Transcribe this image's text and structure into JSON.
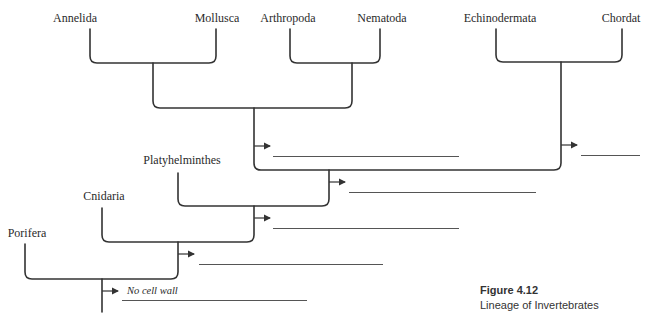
{
  "figure": {
    "number": "Figure 4.12",
    "caption": "Lineage of Invertebrates"
  },
  "taxa": {
    "annelida": "Annelida",
    "mollusca": "Mollusca",
    "arthropoda": "Arthropoda",
    "nematoda": "Nematoda",
    "echinodermata": "Echinodermata",
    "chordata": "Chordat",
    "platyhelminthes": "Platyhelminthes",
    "cnidaria": "Cnidaria",
    "porifera": "Porifera"
  },
  "characters": {
    "first": "No cell wall",
    "second": "",
    "third": "",
    "fourth": "",
    "fifth": "",
    "sixth": ""
  },
  "colors": {
    "line": "#333333",
    "blank_line": "#555555"
  }
}
